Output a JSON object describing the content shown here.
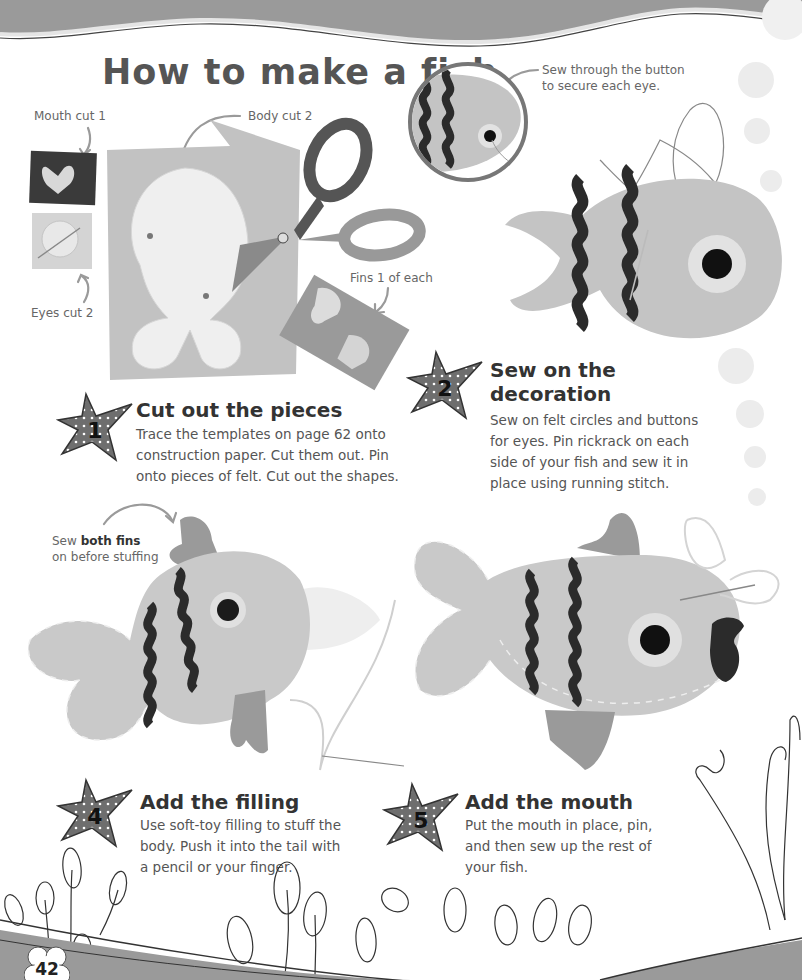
{
  "page": {
    "title": "How to make a fish",
    "page_number": "42"
  },
  "annotations": {
    "mouth": "Mouth cut 1",
    "body": "Body cut 2",
    "eyes": "Eyes cut 2",
    "fins": "Fins 1 of each",
    "sew_button_line1": "Sew through the button",
    "sew_button_line2": "to secure each eye.",
    "sew_fins_prefix": "Sew ",
    "sew_fins_bold": "both fins",
    "sew_fins_line2": "on before stuffing"
  },
  "steps": [
    {
      "number": "1",
      "title": "Cut out the pieces",
      "body_lines": [
        "Trace the templates on page 62 onto",
        "construction paper. Cut them out. Pin",
        "onto pieces of felt. Cut out the shapes."
      ]
    },
    {
      "number": "2",
      "title_lines": [
        "Sew on the",
        "decoration"
      ],
      "body_lines": [
        "Sew on felt circles and buttons",
        "for eyes. Pin rickrack on each",
        "side of your fish and sew it in",
        "place using running stitch."
      ]
    },
    {
      "number": "4",
      "title": "Add the filling",
      "body_lines": [
        "Use soft-toy filling to stuff the",
        "body. Push it into the tail with",
        "a pencil or your finger."
      ]
    },
    {
      "number": "5",
      "title": "Add the mouth",
      "body_lines": [
        "Put the mouth in place, pin,",
        "and then sew up the rest of",
        "your fish."
      ]
    }
  ],
  "colors": {
    "wave_band": "#9a9a9a",
    "felt_light": "#c9c9c9",
    "felt_mid": "#a6a6a6",
    "rickrack": "#2b2b2b",
    "star_fill": "#6e6e6e",
    "bubble": "#ececec"
  },
  "icons": {
    "star_badge": "polka-dot-star-icon",
    "arrow": "curved-arrow-icon",
    "seaweed": "seaweed-icon",
    "page_flower": "flower-badge-icon"
  }
}
